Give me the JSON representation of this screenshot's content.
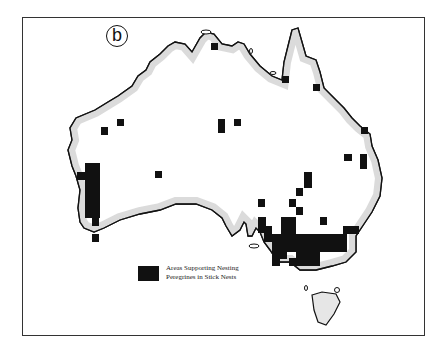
{
  "figure": {
    "panel_label": "b",
    "legend": {
      "swatch_color": "#111111",
      "text": "Areas Supporting Nesting Peregrines in Stick Nests"
    },
    "map_region": "Australia",
    "colors": {
      "land": "#ffffff",
      "coast_stipple": "#9a9a9a",
      "coastline": "#111111",
      "nest_area": "#111111",
      "frame": "#333333"
    },
    "nest_cells": [
      {
        "x": 211,
        "y": 43,
        "w": 7,
        "h": 7
      },
      {
        "x": 282,
        "y": 76,
        "w": 7,
        "h": 7
      },
      {
        "x": 313,
        "y": 84,
        "w": 7,
        "h": 7
      },
      {
        "x": 101,
        "y": 127,
        "w": 7,
        "h": 8
      },
      {
        "x": 117,
        "y": 119,
        "w": 7,
        "h": 7
      },
      {
        "x": 218,
        "y": 119,
        "w": 7,
        "h": 14
      },
      {
        "x": 234,
        "y": 119,
        "w": 7,
        "h": 7
      },
      {
        "x": 361,
        "y": 127,
        "w": 7,
        "h": 7
      },
      {
        "x": 344,
        "y": 154,
        "w": 8,
        "h": 7
      },
      {
        "x": 360,
        "y": 154,
        "w": 7,
        "h": 15
      },
      {
        "x": 155,
        "y": 171,
        "w": 7,
        "h": 7
      },
      {
        "x": 304,
        "y": 172,
        "w": 8,
        "h": 16
      },
      {
        "x": 296,
        "y": 188,
        "w": 7,
        "h": 8
      },
      {
        "x": 258,
        "y": 199,
        "w": 7,
        "h": 8
      },
      {
        "x": 289,
        "y": 199,
        "w": 7,
        "h": 8
      },
      {
        "x": 296,
        "y": 207,
        "w": 7,
        "h": 8
      },
      {
        "x": 320,
        "y": 217,
        "w": 7,
        "h": 8
      },
      {
        "x": 85,
        "y": 163,
        "w": 15,
        "h": 55
      },
      {
        "x": 77,
        "y": 172,
        "w": 8,
        "h": 8
      },
      {
        "x": 92,
        "y": 218,
        "w": 7,
        "h": 8
      },
      {
        "x": 92,
        "y": 234,
        "w": 7,
        "h": 8
      },
      {
        "x": 258,
        "y": 217,
        "w": 8,
        "h": 16
      },
      {
        "x": 264,
        "y": 226,
        "w": 8,
        "h": 16
      },
      {
        "x": 281,
        "y": 217,
        "w": 15,
        "h": 26
      },
      {
        "x": 272,
        "y": 234,
        "w": 75,
        "h": 18
      },
      {
        "x": 343,
        "y": 226,
        "w": 16,
        "h": 8
      },
      {
        "x": 272,
        "y": 250,
        "w": 15,
        "h": 9
      },
      {
        "x": 296,
        "y": 250,
        "w": 24,
        "h": 8
      },
      {
        "x": 272,
        "y": 258,
        "w": 8,
        "h": 8
      },
      {
        "x": 289,
        "y": 258,
        "w": 31,
        "h": 8
      }
    ]
  }
}
